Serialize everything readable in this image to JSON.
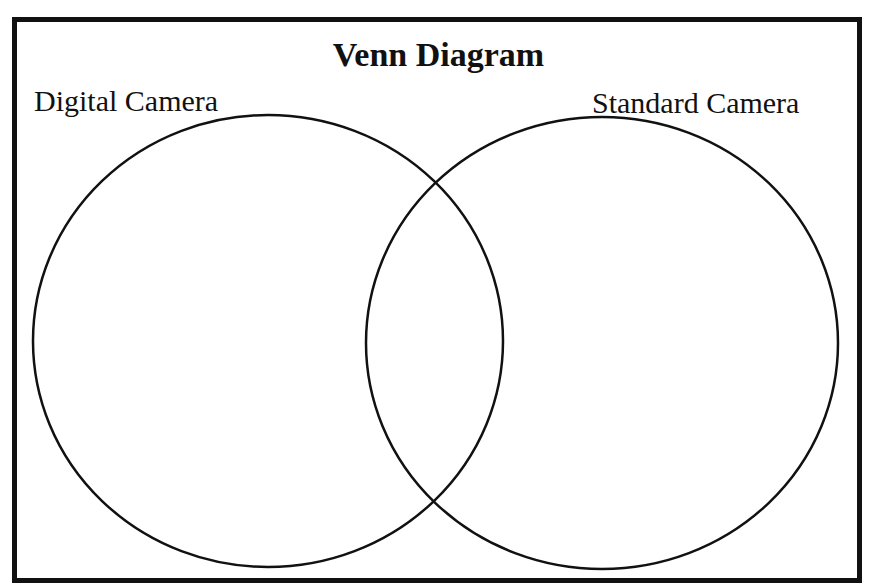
{
  "diagram": {
    "title": "Venn Diagram",
    "sets": [
      {
        "name": "left-set",
        "label": "Digital Camera"
      },
      {
        "name": "right-set",
        "label": "Standard Camera"
      }
    ],
    "colors": {
      "stroke": "#111111",
      "background": "#ffffff"
    }
  }
}
